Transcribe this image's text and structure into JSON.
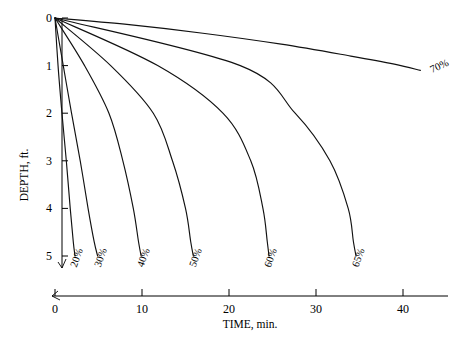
{
  "chart_data": {
    "type": "line",
    "title": "",
    "xlabel": "TIME, min.",
    "ylabel": "DEPTH, ft.",
    "xlim": [
      0,
      44
    ],
    "ylim": [
      0,
      5.6
    ],
    "y_inverted": true,
    "grid": false,
    "legend": "inline-end-labels",
    "xticks": [
      0,
      10,
      20,
      30,
      40
    ],
    "xtick_labels": [
      "0",
      "10",
      "20",
      "30",
      "40"
    ],
    "yticks": [
      0,
      1,
      2,
      3,
      4,
      5
    ],
    "ytick_labels": [
      "0",
      "1",
      "2",
      "3",
      "4",
      "5"
    ],
    "axis_break_x": true,
    "axis_break_y": true,
    "series": [
      {
        "name": "20%",
        "label": "20%",
        "label_rotation": -70,
        "x": [
          0,
          0.35,
          0.8,
          1.3,
          1.75,
          2.1,
          2.3
        ],
        "y": [
          0,
          1.0,
          2.0,
          3.0,
          4.0,
          4.7,
          5.0
        ]
      },
      {
        "name": "30%",
        "label": "30%",
        "label_rotation": -70,
        "x": [
          0,
          0.95,
          1.9,
          2.9,
          3.8,
          4.5,
          4.9
        ],
        "y": [
          0,
          1.0,
          2.0,
          3.0,
          4.0,
          4.7,
          5.0
        ]
      },
      {
        "name": "40%",
        "label": "40%",
        "label_rotation": -70,
        "x": [
          0,
          3.4,
          6.2,
          7.8,
          9.0,
          9.6,
          9.9
        ],
        "y": [
          0,
          1.0,
          2.0,
          3.0,
          4.0,
          4.7,
          5.0
        ]
      },
      {
        "name": "50%",
        "label": "50%",
        "label_rotation": -70,
        "x": [
          0,
          6.4,
          11.3,
          13.5,
          15.0,
          15.6,
          15.9
        ],
        "y": [
          0,
          1.0,
          2.0,
          3.0,
          4.0,
          4.7,
          5.0
        ]
      },
      {
        "name": "60%",
        "label": "60%",
        "label_rotation": -70,
        "x": [
          0,
          11.8,
          19.3,
          22.5,
          23.9,
          24.4,
          24.6
        ],
        "y": [
          0,
          1.0,
          2.0,
          3.0,
          4.0,
          4.7,
          5.0
        ]
      },
      {
        "name": "65%",
        "label": "65%",
        "label_rotation": -70,
        "x": [
          0,
          21.3,
          27.6,
          31.6,
          33.7,
          34.3,
          34.6
        ],
        "y": [
          0,
          1.0,
          2.0,
          3.0,
          4.0,
          4.7,
          5.0
        ]
      },
      {
        "name": "70%",
        "label": "70%",
        "label_rotation": -25,
        "x": [
          0,
          8.0,
          17.0,
          26.0,
          34.0,
          39.0,
          42.0
        ],
        "y": [
          0,
          0.13,
          0.32,
          0.55,
          0.8,
          0.97,
          1.1
        ]
      }
    ]
  },
  "axes": {
    "x_title": "TIME, min.",
    "y_title": "DEPTH, ft."
  }
}
